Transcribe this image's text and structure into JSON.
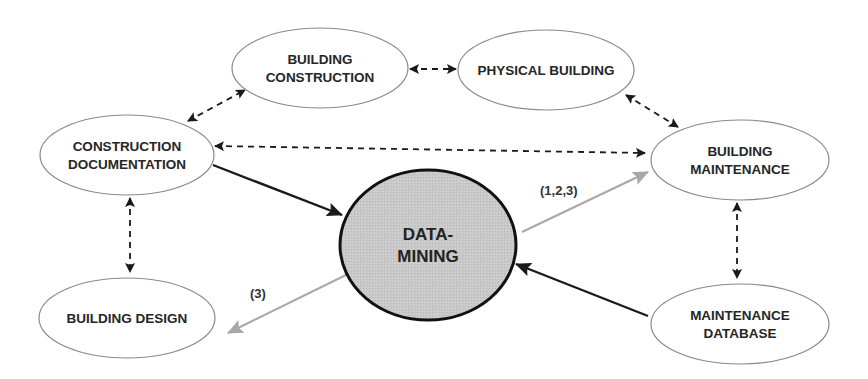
{
  "diagram": {
    "colors": {
      "background": "#ffffff",
      "node_stroke": "#8a8a8a",
      "center_fill": "#c9c9c9",
      "center_stroke": "#111111",
      "solid_arrow": "#1a1a1a",
      "gray_arrow": "#a8a8a8",
      "dashed_arrow": "#1a1a1a"
    },
    "nodes": [
      {
        "id": "building-construction",
        "lines": [
          "BUILDING",
          "CONSTRUCTION"
        ],
        "cx": 320,
        "cy": 68,
        "rx": 88,
        "ry": 40
      },
      {
        "id": "physical-building",
        "lines": [
          "PHYSICAL BUILDING"
        ],
        "cx": 546,
        "cy": 70,
        "rx": 88,
        "ry": 40
      },
      {
        "id": "construction-documentation",
        "lines": [
          "CONSTRUCTION",
          "DOCUMENTATION"
        ],
        "cx": 127,
        "cy": 155,
        "rx": 87,
        "ry": 40
      },
      {
        "id": "building-maintenance",
        "lines": [
          "BUILDING",
          "MAINTENANCE"
        ],
        "cx": 740,
        "cy": 160,
        "rx": 89,
        "ry": 40
      },
      {
        "id": "data-mining",
        "lines": [
          "DATA-",
          "MINING"
        ],
        "cx": 428,
        "cy": 245,
        "rx": 88,
        "ry": 75,
        "center": true
      },
      {
        "id": "building-design",
        "lines": [
          "BUILDING DESIGN"
        ],
        "cx": 127,
        "cy": 318,
        "rx": 88,
        "ry": 40
      },
      {
        "id": "maintenance-database",
        "lines": [
          "MAINTENANCE",
          "DATABASE"
        ],
        "cx": 740,
        "cy": 324,
        "rx": 89,
        "ry": 40
      }
    ],
    "edges": [
      {
        "from": "building-construction",
        "to": "physical-building",
        "style": "dashed",
        "bidirectional": true,
        "x1": 410,
        "y1": 69,
        "x2": 456,
        "y2": 69
      },
      {
        "from": "construction-documentation",
        "to": "building-construction",
        "style": "dashed",
        "bidirectional": true,
        "x1": 188,
        "y1": 121,
        "x2": 245,
        "y2": 90
      },
      {
        "from": "physical-building",
        "to": "building-maintenance",
        "style": "dashed",
        "bidirectional": true,
        "x1": 626,
        "y1": 95,
        "x2": 678,
        "y2": 127
      },
      {
        "from": "construction-documentation",
        "to": "building-maintenance",
        "style": "dashed",
        "bidirectional": true,
        "x1": 215,
        "y1": 146,
        "x2": 645,
        "y2": 153
      },
      {
        "from": "construction-documentation",
        "to": "building-design",
        "style": "dashed",
        "bidirectional": true,
        "x1": 130,
        "y1": 198,
        "x2": 130,
        "y2": 272
      },
      {
        "from": "building-maintenance",
        "to": "maintenance-database",
        "style": "dashed",
        "bidirectional": true,
        "x1": 737,
        "y1": 203,
        "x2": 737,
        "y2": 278
      },
      {
        "from": "construction-documentation",
        "to": "data-mining",
        "style": "solid",
        "x1": 213,
        "y1": 165,
        "x2": 342,
        "y2": 215
      },
      {
        "from": "maintenance-database",
        "to": "data-mining",
        "style": "solid",
        "x1": 648,
        "y1": 316,
        "x2": 516,
        "y2": 264
      },
      {
        "from": "data-mining",
        "to": "building-maintenance",
        "style": "gray",
        "x1": 522,
        "y1": 232,
        "x2": 648,
        "y2": 172,
        "label": "(1,2,3)",
        "lx": 540,
        "ly": 195
      },
      {
        "from": "data-mining",
        "to": "building-design",
        "style": "gray",
        "x1": 348,
        "y1": 274,
        "x2": 228,
        "y2": 333,
        "label": "(3)",
        "lx": 250,
        "ly": 298
      }
    ]
  }
}
